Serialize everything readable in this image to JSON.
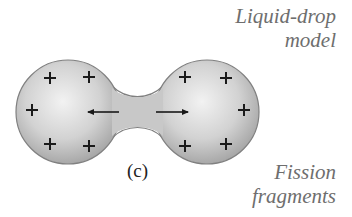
{
  "labels": {
    "top_line1": "Liquid-drop",
    "top_line2": "model",
    "bottom_line1": "Fission",
    "bottom_line2": "fragments",
    "panel": "(c)"
  },
  "diagram": {
    "charge_symbol": "+",
    "charges_per_lobe": 5,
    "colors": {
      "drop_fill_light": "#eeeeee",
      "drop_fill_dark": "#b4b4b4",
      "drop_outline": "#808080",
      "charge": "#1a1a1a",
      "arrow": "#1a1a1a",
      "label_text": "#6e6e6e"
    }
  }
}
